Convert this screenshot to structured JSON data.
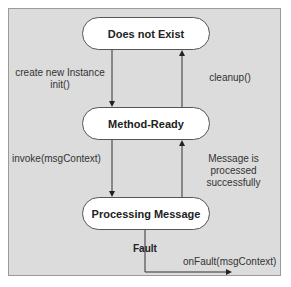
{
  "diagram": {
    "type": "state-diagram",
    "nodes": [
      {
        "id": "does-not-exist",
        "label": "Does not Exist"
      },
      {
        "id": "method-ready",
        "label": "Method-Ready"
      },
      {
        "id": "processing-message",
        "label": "Processing Message"
      }
    ],
    "edges": [
      {
        "from": "does-not-exist",
        "to": "method-ready",
        "label_line1": "create new Instance",
        "label_line2": "init()"
      },
      {
        "from": "method-ready",
        "to": "does-not-exist",
        "label": "cleanup()"
      },
      {
        "from": "method-ready",
        "to": "processing-message",
        "label": "invoke(msgContext)"
      },
      {
        "from": "processing-message",
        "to": "method-ready",
        "label_line1": "Message is",
        "label_line2": "processed",
        "label_line3": "successfully"
      },
      {
        "from": "processing-message",
        "to": "external",
        "label": "Fault",
        "action": "onFault(msgContext)"
      }
    ],
    "colors": {
      "panel": "#dcdcdc",
      "node_fill": "#ffffff",
      "line": "#333333"
    }
  }
}
